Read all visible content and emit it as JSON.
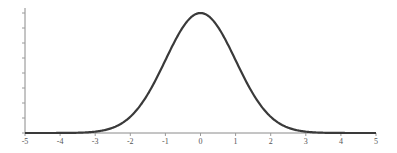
{
  "chart_data": {
    "type": "line",
    "title": "",
    "xlabel": "",
    "ylabel": "",
    "xlim": [
      -5,
      5
    ],
    "ylim": [
      0,
      0.4
    ],
    "x_ticks": [
      -5,
      -4,
      -3,
      -2,
      -1,
      0,
      1,
      2,
      3,
      4,
      5
    ],
    "x_tick_labels": [
      "-5",
      "-4",
      "-3",
      "-2",
      "-1",
      "0",
      "1",
      "2",
      "3",
      "4",
      "5"
    ],
    "y_ticks": [
      0,
      0.05,
      0.1,
      0.15,
      0.2,
      0.25,
      0.3,
      0.35,
      0.4
    ],
    "y_tick_labels": [],
    "grid": false,
    "legend": null,
    "series": [
      {
        "name": "Standard normal density",
        "function": "exp(-x^2/2)/sqrt(2*pi)",
        "x": [
          -5,
          -4.5,
          -4,
          -3.5,
          -3,
          -2.5,
          -2,
          -1.5,
          -1,
          -0.5,
          0,
          0.5,
          1,
          1.5,
          2,
          2.5,
          3,
          3.5,
          4,
          4.5,
          5
        ],
        "y": [
          1.5e-06,
          1.6e-05,
          0.000134,
          0.000873,
          0.004432,
          0.017528,
          0.053991,
          0.129518,
          0.241971,
          0.352065,
          0.398942,
          0.352065,
          0.241971,
          0.129518,
          0.053991,
          0.017528,
          0.004432,
          0.000873,
          0.000134,
          1.6e-05,
          1.5e-06
        ],
        "color": "#3a3a3a"
      }
    ]
  },
  "colors": {
    "curve": "#3a3a3a",
    "axis": "#8a8a8a",
    "background": "#ffffff"
  }
}
